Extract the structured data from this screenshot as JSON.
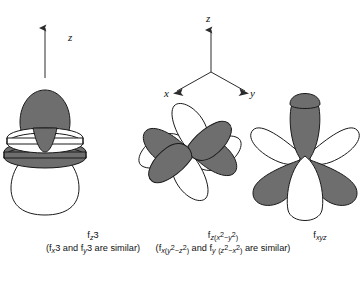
{
  "figure": {
    "background_color": "#ffffff",
    "lobe_fill_shaded": "#6e6e6e",
    "lobe_fill_unshaded": "#ffffff",
    "stroke_color": "#1a1a1a"
  },
  "axes": {
    "left_axis": {
      "label": "z",
      "direction": "up"
    },
    "center_axes": [
      {
        "label": "z",
        "direction": "up"
      },
      {
        "label": "x",
        "direction": "down-left"
      },
      {
        "label": "y",
        "direction": "down-right"
      }
    ],
    "right_axis_visible_label": "y"
  },
  "orbitals": [
    {
      "id": "fz3",
      "name_main": "f",
      "name_sub_pre": "z",
      "name_sub_post": "3",
      "caption_main_text": "fz3",
      "caption_sub_text": "(fx3 and fy3 are similar)",
      "similar_1": "fx3",
      "similar_2": "fy3",
      "lobe_count": 2,
      "torus_count": 2,
      "description": "two axial lobes with two tori"
    },
    {
      "id": "fzx2-y2",
      "caption_main_text": "fz(x2-y2)",
      "caption_sub_text": "(fx(y2-z2) and fy(z2-x2) are similar)",
      "similar_1": "fx(y2-z2)",
      "similar_2": "fy(z2-x2)",
      "lobe_count": 8,
      "description": "eight-lobed cubic set"
    },
    {
      "id": "fxyz",
      "caption_main_text": "fxyz",
      "caption_sub_text": "",
      "lobe_count": 8,
      "description": "eight lobes pointing to cube corners"
    }
  ],
  "captions": {
    "similar_phrase": "are similar",
    "and_word": "and"
  }
}
